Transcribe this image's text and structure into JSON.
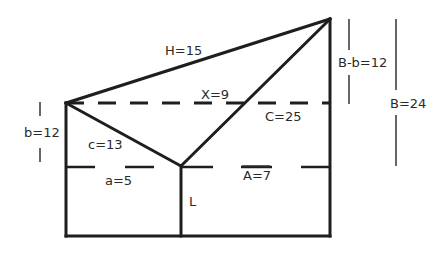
{
  "diagram": {
    "labels": {
      "H": "H=15",
      "X": "X=9",
      "C": "C=25",
      "c": "c=13",
      "a": "a=5",
      "A": "A=7",
      "L": "L",
      "b": "b=12",
      "Bb": "B-b=12",
      "B": "B=24"
    },
    "colors": {
      "stroke": "#1e1e1e",
      "text": "#2a2a2a",
      "background": "#ffffff"
    }
  }
}
